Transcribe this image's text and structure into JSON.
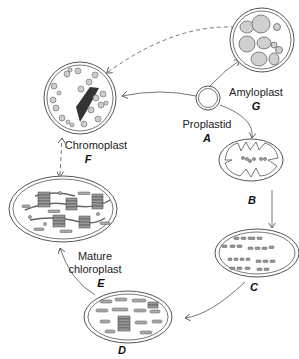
{
  "diagram": {
    "nodes": [
      {
        "id": "A",
        "name": "Proplastid",
        "letter": "A"
      },
      {
        "id": "B",
        "name": "",
        "letter": "B"
      },
      {
        "id": "C",
        "name": "",
        "letter": "C"
      },
      {
        "id": "D",
        "name": "",
        "letter": "D"
      },
      {
        "id": "E",
        "name_line1": "Mature",
        "name_line2": "chloroplast",
        "letter": "E"
      },
      {
        "id": "F",
        "name": "Chromoplast",
        "letter": "F"
      },
      {
        "id": "G",
        "name": "Amyloplast",
        "letter": "G"
      }
    ],
    "edges": [
      {
        "from": "A",
        "to": "G",
        "style": "solid"
      },
      {
        "from": "A",
        "to": "F",
        "style": "solid"
      },
      {
        "from": "A",
        "to": "B",
        "style": "solid"
      },
      {
        "from": "B",
        "to": "C",
        "style": "solid"
      },
      {
        "from": "C",
        "to": "D",
        "style": "solid"
      },
      {
        "from": "D",
        "to": "E",
        "style": "solid"
      },
      {
        "from": "E",
        "to": "F",
        "style": "dashed",
        "bidirectional": true
      },
      {
        "from": "F",
        "to": "G",
        "style": "dashed",
        "bidirectional": true
      }
    ],
    "colors": {
      "stroke": "#555555",
      "fill": "#d0d0d0",
      "dark": "#333333"
    }
  }
}
